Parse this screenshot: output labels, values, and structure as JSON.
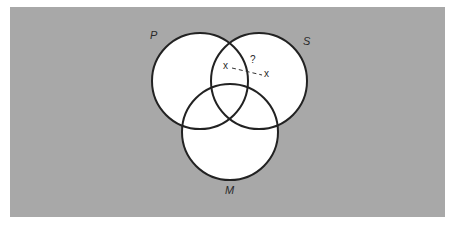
{
  "diagram": {
    "type": "venn",
    "sets": [
      {
        "label": "P",
        "cx": 200,
        "cy": 81,
        "r": 48
      },
      {
        "label": "S",
        "cx": 259,
        "cy": 81,
        "r": 48
      },
      {
        "label": "M",
        "cx": 230,
        "cy": 132,
        "r": 48
      }
    ],
    "annotations": {
      "x_left": "x",
      "x_right": "x",
      "question": "?"
    },
    "colors": {
      "background": "#a8a8a8",
      "circle_fill": "#ffffff",
      "stroke": "#222222"
    }
  }
}
